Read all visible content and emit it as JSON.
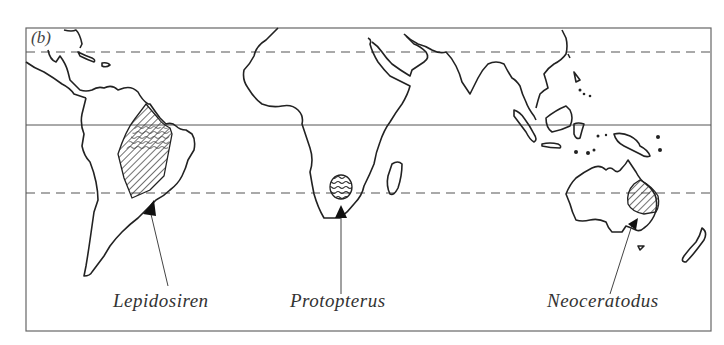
{
  "figure": {
    "panel_label": "(b)",
    "lines": {
      "tropic_of_cancer": "dashed",
      "equator": "solid",
      "tropic_of_capricorn": "dashed"
    },
    "colors": {
      "coast": "#222222",
      "frame": "#666666",
      "hatch": "#333333"
    }
  },
  "species": [
    {
      "name": "Lepidosiren",
      "region": "South America"
    },
    {
      "name": "Protopterus",
      "region": "Africa"
    },
    {
      "name": "Neoceratodus",
      "region": "Australia"
    }
  ]
}
